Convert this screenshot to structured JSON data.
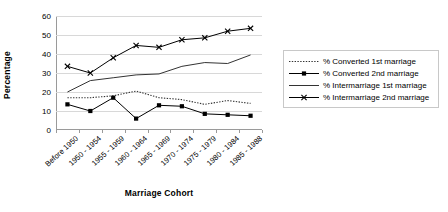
{
  "chart_data": {
    "type": "line",
    "title": "",
    "xlabel": "Marriage Cohort",
    "ylabel": "Percentage",
    "ylim": [
      0,
      60
    ],
    "yticks": [
      0,
      10,
      20,
      30,
      40,
      50,
      60
    ],
    "grid": true,
    "legend_position": "right",
    "categories": [
      "Before 1950",
      "1950 - 1954",
      "1955 - 1959",
      "1960 - 1964",
      "1965 - 1969",
      "1970 - 1974",
      "1975 - 1979",
      "1980 - 1984",
      "1985 - 1988"
    ],
    "series": [
      {
        "name": "% Converted 1st marriage",
        "style": "dotted",
        "marker": "none",
        "color": "#333333",
        "values": [
          17,
          17,
          18,
          20.5,
          17,
          16,
          13.5,
          15.5,
          14
        ]
      },
      {
        "name": "% Converted 2nd marriage",
        "style": "solid",
        "marker": "square",
        "color": "#000000",
        "values": [
          13.5,
          10,
          17,
          6,
          13,
          12.5,
          8.5,
          8,
          7.5
        ]
      },
      {
        "name": "% Intermarriage 1st marriage",
        "style": "solid",
        "marker": "none",
        "color": "#333333",
        "values": [
          20,
          26,
          27.5,
          29,
          29.5,
          33.5,
          35.5,
          35,
          39.5
        ]
      },
      {
        "name": "% Intermarriage 2nd marriage",
        "style": "solid",
        "marker": "x",
        "color": "#000000",
        "values": [
          33.5,
          30,
          38,
          44.5,
          43.5,
          47.5,
          48.5,
          52,
          53.5
        ]
      }
    ]
  }
}
